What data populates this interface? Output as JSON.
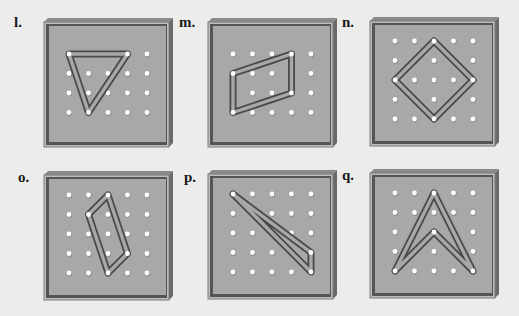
{
  "figure": {
    "type": "geoboard-exercises",
    "colors": {
      "background": "#ececea",
      "board_face": "#a8a8a6",
      "board_frame": "#555555",
      "board_bevel": "#8a8a8a",
      "band": "#4a4a4a",
      "peg": "#ffffff"
    },
    "boards": [
      {
        "label": "l.",
        "rows": 4,
        "cols": 5,
        "shape": "triangle",
        "vertices": [
          [
            0,
            0
          ],
          [
            3,
            0
          ],
          [
            1,
            3
          ]
        ]
      },
      {
        "label": "m.",
        "rows": 4,
        "cols": 5,
        "shape": "parallelogram",
        "vertices": [
          [
            3,
            0
          ],
          [
            3,
            2
          ],
          [
            0,
            3
          ],
          [
            0,
            1
          ]
        ]
      },
      {
        "label": "n.",
        "rows": 5,
        "cols": 5,
        "shape": "square",
        "vertices": [
          [
            2,
            0
          ],
          [
            4,
            2
          ],
          [
            2,
            4
          ],
          [
            0,
            2
          ]
        ]
      },
      {
        "label": "o.",
        "rows": 5,
        "cols": 5,
        "shape": "quadrilateral",
        "vertices": [
          [
            2,
            0
          ],
          [
            3,
            3
          ],
          [
            2,
            4
          ],
          [
            1,
            1
          ]
        ]
      },
      {
        "label": "p.",
        "rows": 5,
        "cols": 5,
        "shape": "triangle",
        "vertices": [
          [
            0,
            0
          ],
          [
            4,
            3
          ],
          [
            4,
            4
          ]
        ]
      },
      {
        "label": "q.",
        "rows": 5,
        "cols": 5,
        "shape": "concave-hexagon",
        "vertices": [
          [
            2,
            0
          ],
          [
            4,
            4
          ],
          [
            2,
            2
          ],
          [
            0,
            4
          ]
        ]
      }
    ]
  }
}
